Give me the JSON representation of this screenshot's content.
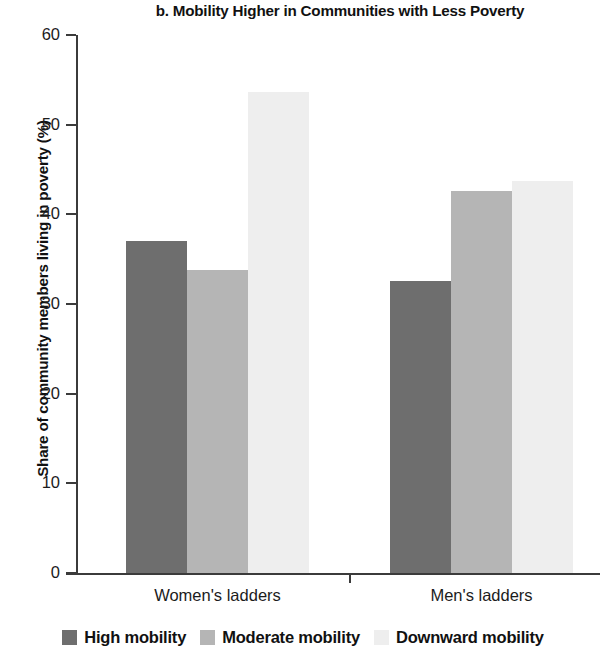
{
  "chart_data": {
    "type": "bar",
    "title": "b. Mobility Higher in Communities with Less Poverty",
    "xlabel": "",
    "ylabel": "Share of community members living in poverty (%)",
    "categories": [
      "Women's ladders",
      "Men's ladders"
    ],
    "series": [
      {
        "name": "High mobility",
        "color": "#6e6e6e",
        "values": [
          37.0,
          32.6
        ]
      },
      {
        "name": "Moderate mobility",
        "color": "#b5b5b5",
        "values": [
          33.8,
          42.6
        ]
      },
      {
        "name": "Downward mobility",
        "color": "#eeeeee",
        "values": [
          53.6,
          43.7
        ]
      }
    ],
    "ylim": [
      0,
      60
    ],
    "yticks": [
      0,
      10,
      20,
      30,
      40,
      50,
      60
    ],
    "ytick_labels": [
      "0",
      "10",
      "20",
      "30",
      "40",
      "50",
      "60"
    ],
    "grid": false,
    "legend_position": "bottom"
  },
  "axis": {
    "y_tick_0": "0",
    "y_tick_1": "10",
    "y_tick_2": "20",
    "y_tick_3": "30",
    "y_tick_4": "40",
    "y_tick_5": "50",
    "y_tick_6": "60"
  },
  "categories": {
    "women": "Women's ladders",
    "men": "Men's ladders"
  },
  "legend": {
    "high": "High mobility",
    "moderate": "Moderate mobility",
    "downward": "Downward mobility"
  }
}
